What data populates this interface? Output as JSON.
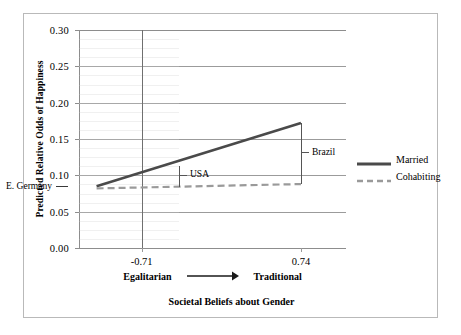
{
  "chart_data": {
    "type": "line",
    "title": "",
    "xlabel": "Societal Beliefs about Gender",
    "ylabel": "Predicted Relative Odds of Happiness",
    "xlim": [
      -1.28,
      1.15
    ],
    "ylim": [
      0.0,
      0.3
    ],
    "grid": true,
    "legend_position": "right-outside",
    "x_axis_direction_left": "Egalitarian",
    "x_axis_direction_right": "Traditional",
    "x_axis_direction_arrow": "⟶",
    "x_ticks": [
      {
        "value": -0.71,
        "label": "-0.71"
      },
      {
        "value": 0.74,
        "label": "0.74"
      }
    ],
    "y_ticks": [
      {
        "value": 0.0,
        "label": "0.00"
      },
      {
        "value": 0.05,
        "label": "0.05"
      },
      {
        "value": 0.1,
        "label": "0.10"
      },
      {
        "value": 0.15,
        "label": "0.15"
      },
      {
        "value": 0.2,
        "label": "0.20"
      },
      {
        "value": 0.25,
        "label": "0.25"
      },
      {
        "value": 0.3,
        "label": "0.30"
      }
    ],
    "series": [
      {
        "name": "Married",
        "style": "solid",
        "color": "#4a4a4a",
        "points": [
          {
            "x": -1.12,
            "y": 0.085
          },
          {
            "x": 0.74,
            "y": 0.172
          }
        ]
      },
      {
        "name": "Cohabiting",
        "style": "dashed",
        "color": "#9a9a9a",
        "points": [
          {
            "x": -1.12,
            "y": 0.082
          },
          {
            "x": 0.74,
            "y": 0.088
          }
        ]
      }
    ],
    "annotations": [
      {
        "text": "E. Germany",
        "x": -1.12,
        "y": 0.083,
        "kind": "pointer-left"
      },
      {
        "text": "USA",
        "x": -0.37,
        "y_top": 0.113,
        "y_bottom": 0.084,
        "kind": "bracket"
      },
      {
        "text": "Brazil",
        "x": 0.74,
        "y_top": 0.172,
        "y_bottom": 0.088,
        "kind": "bracket"
      }
    ],
    "reference_line": {
      "x": -0.71,
      "style": "solid",
      "color": "#6f6f6f"
    }
  },
  "legend": {
    "entries": [
      {
        "label": "Married"
      },
      {
        "label": "Cohabiting"
      }
    ]
  },
  "axis": {
    "y_title": "Predicted Relative Odds of Happiness",
    "x_title": "Societal Beliefs about Gender"
  }
}
